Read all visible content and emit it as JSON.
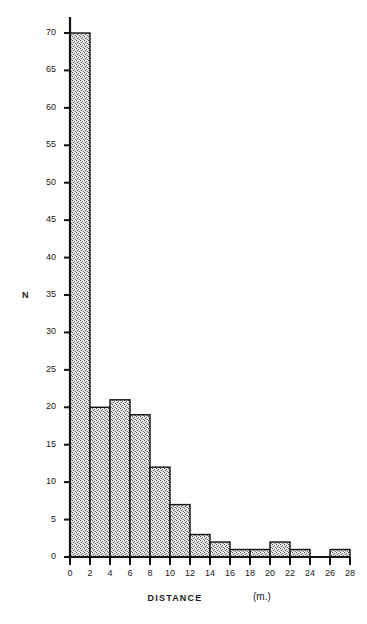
{
  "chart_data": {
    "type": "bar",
    "title": "",
    "subtitle": "",
    "xlabel": "DISTANCE",
    "xunit": "(m.)",
    "ylabel": "N",
    "xlim": [
      0,
      28
    ],
    "ylim": [
      0,
      70
    ],
    "grid": false,
    "legend": null,
    "bin_width": 2,
    "bin_edges": [
      0,
      2,
      4,
      6,
      8,
      10,
      12,
      14,
      16,
      18,
      20,
      22,
      24,
      26,
      28
    ],
    "categories": [
      "0-2",
      "2-4",
      "4-6",
      "6-8",
      "8-10",
      "10-12",
      "12-14",
      "14-16",
      "16-18",
      "18-20",
      "20-22",
      "22-24",
      "24-26",
      "26-28"
    ],
    "values": [
      70,
      20,
      21,
      19,
      12,
      7,
      3,
      2,
      1,
      1,
      2,
      1,
      0,
      1
    ],
    "xticks": [
      0,
      2,
      4,
      6,
      8,
      10,
      12,
      14,
      16,
      18,
      20,
      22,
      24,
      26,
      28
    ],
    "xtick_labels": [
      "0",
      "2",
      "4",
      "6",
      "8",
      "10",
      "12",
      "14",
      "16",
      "18",
      "20",
      "22",
      "24",
      "26",
      "28"
    ],
    "yticks": [
      0,
      5,
      10,
      15,
      20,
      25,
      30,
      35,
      40,
      45,
      50,
      55,
      60,
      65,
      70
    ],
    "ytick_labels": [
      "0",
      "5",
      "10",
      "15",
      "20",
      "25",
      "30",
      "35",
      "40",
      "45",
      "50",
      "55",
      "60",
      "65",
      "70"
    ],
    "bar_fill": "#d8d8d8",
    "bar_edge": "#111111",
    "axis_color": "#111111",
    "background": "#fefefe",
    "fill_style": "stipple"
  },
  "layout": {
    "plot_left": 70,
    "plot_right": 350,
    "plot_top": 33,
    "plot_bottom": 557,
    "axis_top_overhang": 16
  }
}
